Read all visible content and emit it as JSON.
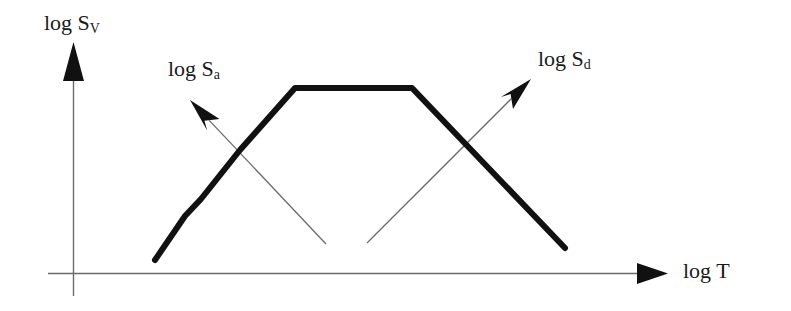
{
  "figure": {
    "title": "",
    "background_color": "#ffffff",
    "stroke_color": "#000000",
    "axis_color": "#595959",
    "curve_color": "#111111"
  },
  "labels": {
    "y_axis": {
      "text": "log S",
      "subscript": "V",
      "full": "log S_V"
    },
    "x_axis": {
      "text": "log T",
      "subscript": "",
      "full": "log T"
    },
    "acceleration_arrow": {
      "text": "log S",
      "subscript": "a",
      "full": "log S_a"
    },
    "displacement_arrow": {
      "text": "log S",
      "subscript": "d",
      "full": "log S_d"
    }
  },
  "chart_data": {
    "type": "line",
    "title": "",
    "xlabel": "log T",
    "ylabel": "log S_V",
    "grid": false,
    "legend_position": "none",
    "axis_arrows": true,
    "tick_labels": {
      "x": [],
      "y": []
    },
    "series": [
      {
        "name": "Tripartite design spectrum (log S_V vs log T)",
        "style": "thick-polyline",
        "color": "#111111",
        "linewidth": 6,
        "points_px": [
          [
            155,
            260
          ],
          [
            185,
            216
          ],
          [
            201,
            199
          ],
          [
            240,
            150
          ],
          [
            295,
            88
          ],
          [
            412,
            88
          ],
          [
            565,
            248
          ]
        ],
        "segments": [
          {
            "name": "ascending-lower",
            "slope": "steep-positive"
          },
          {
            "name": "ascending-upper",
            "slope": "positive"
          },
          {
            "name": "plateau",
            "slope": "zero"
          },
          {
            "name": "descending",
            "slope": "negative"
          }
        ]
      }
    ],
    "annotation_arrows": [
      {
        "name": "log S_a axis",
        "label": "log S_a",
        "direction": "up-left",
        "from_px": [
          326,
          244
        ],
        "to_px": [
          190,
          100
        ]
      },
      {
        "name": "log S_d axis",
        "label": "log S_d",
        "direction": "up-right",
        "from_px": [
          367,
          243
        ],
        "to_px": [
          531,
          79
        ]
      }
    ],
    "axes_px": {
      "x_axis": {
        "from": [
          48,
          273
        ],
        "to": [
          668,
          273
        ],
        "arrow": true
      },
      "y_axis": {
        "from": [
          73,
          296
        ],
        "to": [
          73,
          45
        ],
        "arrow": true
      }
    }
  }
}
